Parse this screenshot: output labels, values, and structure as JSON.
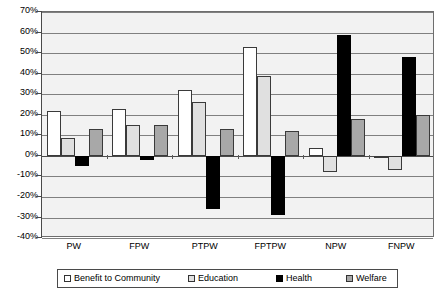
{
  "chart_data": {
    "type": "bar",
    "title": "",
    "subtitle": "",
    "xlabel": "",
    "ylabel": "",
    "categories": [
      "PW",
      "FPW",
      "PTPW",
      "FPTPW",
      "NPW",
      "FNPW"
    ],
    "series": [
      {
        "name": "Benefit to Community",
        "color": "#ffffff",
        "values": [
          22,
          23,
          32,
          53,
          4,
          -1
        ]
      },
      {
        "name": "Education",
        "color": "#e0e0e0",
        "values": [
          8.5,
          15,
          26,
          39,
          -8,
          -7
        ]
      },
      {
        "name": "Health",
        "color": "#000000",
        "values": [
          -5,
          -2,
          -26,
          -29,
          59,
          48
        ]
      },
      {
        "name": "Welfare",
        "color": "#a8a8a8",
        "values": [
          13,
          15,
          13,
          12,
          18,
          20
        ]
      }
    ],
    "ylim": [
      -40,
      70
    ],
    "ytick_step": 10,
    "ytick_labels": [
      "70%",
      "60%",
      "50%",
      "40%",
      "30%",
      "20%",
      "10%",
      "0%",
      "-10%",
      "-20%",
      "-30%",
      "-40%"
    ],
    "ytick_values": [
      70,
      60,
      50,
      40,
      30,
      20,
      10,
      0,
      -10,
      -20,
      -30,
      -40
    ],
    "grid": true,
    "legend_position": "bottom",
    "plot_background": "#f2f2f2",
    "gridline_color": "#808080",
    "axis_color": "#4a4a4a"
  }
}
